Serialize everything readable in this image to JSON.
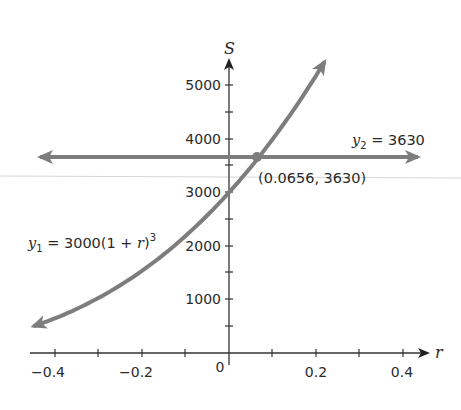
{
  "chart_data": {
    "type": "line",
    "title": "",
    "xlabel": "r",
    "ylabel": "S",
    "xlim": [
      -0.45,
      0.45
    ],
    "ylim": [
      0,
      5500
    ],
    "grid": false,
    "x_ticks": [
      -0.4,
      -0.3,
      -0.2,
      -0.1,
      0.1,
      0.2,
      0.3,
      0.4
    ],
    "x_tick_labels": [
      "−0.4",
      "−0.2",
      "0",
      "0.2",
      "0.4"
    ],
    "x_tick_label_values": [
      -0.4,
      -0.2,
      0,
      0.2,
      0.4
    ],
    "y_ticks": [
      500,
      1000,
      1500,
      2000,
      2500,
      3000,
      3500,
      4000,
      4500,
      5000
    ],
    "y_tick_labels": [
      "1000",
      "2000",
      "3000",
      "4000",
      "5000"
    ],
    "y_tick_label_values": [
      1000,
      2000,
      3000,
      4000,
      5000
    ],
    "series": [
      {
        "name": "y1 = 3000(1 + r)^3",
        "type": "curve",
        "function": "3000*(1+r)^3",
        "r_range": [
          -0.45,
          0.22
        ],
        "x": [
          -0.45,
          -0.4,
          -0.3,
          -0.2,
          -0.1,
          0,
          0.1,
          0.2,
          0.22
        ],
        "values": [
          499,
          648,
          1029,
          1536,
          2187,
          3000,
          3993,
          5184,
          5447
        ],
        "arrows_both_ends": true
      },
      {
        "name": "y2 = 3630",
        "type": "horizontal-line",
        "value": 3630,
        "x_range": [
          -0.46,
          0.46
        ],
        "arrows_both_ends": true
      }
    ],
    "annotations": [
      {
        "text": "(0.0656, 3630)",
        "x": 0.0656,
        "y": 3630,
        "marker": "intersection-point"
      },
      {
        "text": "y1 = 3000(1 + r)^3",
        "label_for": "y1"
      },
      {
        "text": "y2 = 3630",
        "label_for": "y2"
      }
    ]
  },
  "labels": {
    "x_axis": "r",
    "y_axis": "S",
    "origin": "0",
    "x_ticks": [
      "−0.4",
      "−0.2",
      "0.2",
      "0.4"
    ],
    "y_ticks": [
      "5000",
      "4000",
      "3000",
      "2000",
      "1000"
    ],
    "y1_prefix": "y",
    "y1_sub": "1",
    "y1_eq": " = 3000(1 + ",
    "y1_var": "r",
    "y1_close": ")",
    "y1_sup": "3",
    "y2_prefix": "y",
    "y2_sub": "2",
    "y2_eq": " = 3630",
    "intersection": "(0.0656, 3630)"
  },
  "colors": {
    "curve": "#7d7d7d",
    "axis": "#333333",
    "text": "#2a2a2a",
    "artifact_line": "#d6d6d6"
  }
}
